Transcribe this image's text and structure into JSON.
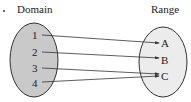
{
  "diagram": {
    "title_domain": "Domain",
    "title_range": "Range",
    "domain": [
      "1",
      "2",
      "3",
      "4"
    ],
    "range": [
      "A",
      "B",
      "C"
    ],
    "mapping": [
      {
        "from": "1",
        "to": "A"
      },
      {
        "from": "2",
        "to": "B"
      },
      {
        "from": "3",
        "to": "C"
      },
      {
        "from": "4",
        "to": "C"
      }
    ],
    "colors": {
      "domain_fill": "#c9c9c9",
      "range_fill": "#ececec",
      "stroke": "#333333"
    }
  }
}
